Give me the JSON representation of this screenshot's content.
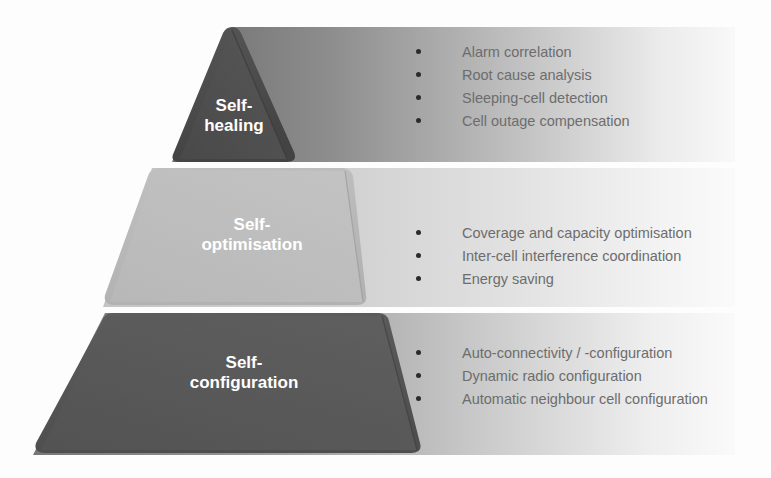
{
  "diagram": {
    "type": "pyramid",
    "background_color": "#fdfdfd",
    "bullet_color": "#2b2b2b",
    "bullet_text_color": "#6d6d6d",
    "label_text_color": "#ffffff",
    "layers": [
      {
        "id": "self-healing",
        "position": "top",
        "label_lines": [
          "Self-",
          "healing"
        ],
        "label_text": "Self-healing",
        "shape": "triangle",
        "pyramid_color": "#4b4b4b",
        "band_color_left": "#6e6e6e",
        "band_color_right": "#f4f4f4",
        "items": [
          "Alarm correlation",
          "Root cause analysis",
          "Sleeping-cell detection",
          "Cell outage compensation"
        ]
      },
      {
        "id": "self-optimisation",
        "position": "middle",
        "label_lines": [
          "Self-",
          "optimisation"
        ],
        "label_text": "Self-optimisation",
        "shape": "trapezoid",
        "pyramid_color": "#b9b9b9",
        "band_color_left": "#c6c6c6",
        "band_color_right": "#f7f7f7",
        "items": [
          "Coverage and capacity optimisation",
          "Inter-cell interference coordination",
          "Energy saving"
        ]
      },
      {
        "id": "self-configuration",
        "position": "bottom",
        "label_lines": [
          "Self-",
          "configuration"
        ],
        "label_text": "Self-configuration",
        "shape": "trapezoid",
        "pyramid_color": "#555555",
        "band_color_left": "#747474",
        "band_color_right": "#f6f6f6",
        "items": [
          "Auto-connectivity / -configuration",
          "Dynamic radio configuration",
          "Automatic neighbour cell configuration"
        ]
      }
    ]
  }
}
